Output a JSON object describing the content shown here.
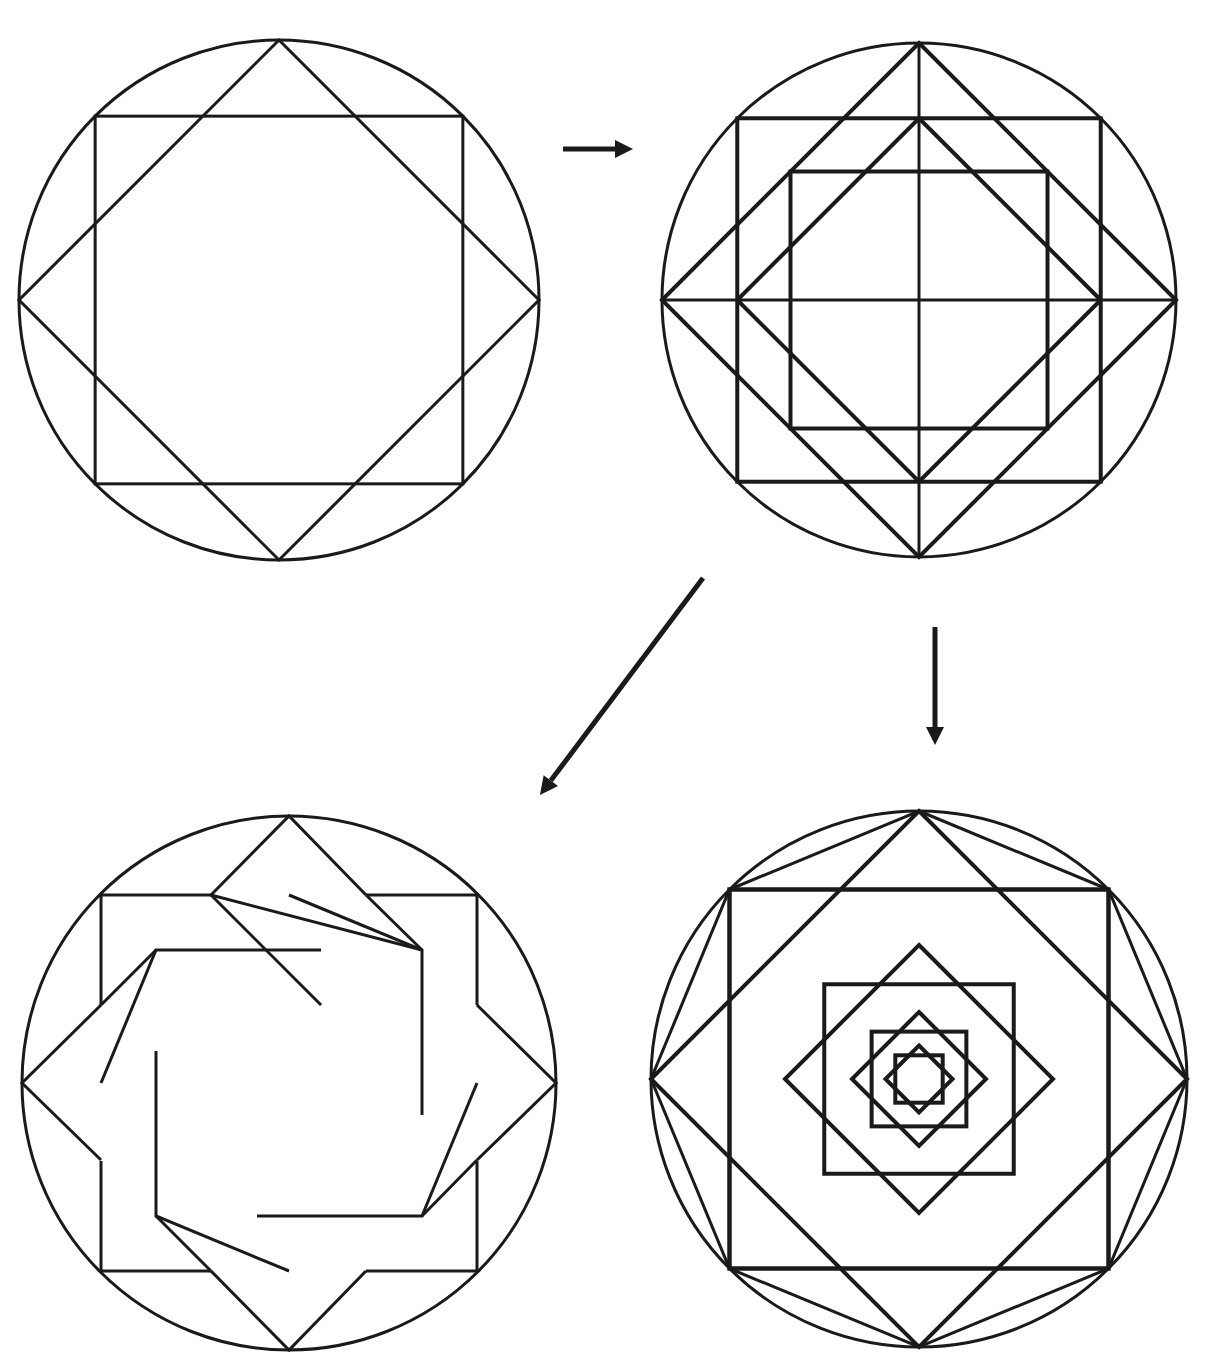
{
  "caption": {
    "text": "",
    "note": "clipped text line at top edge, only descenders visible"
  },
  "colors": {
    "ink": "#1a1a1a",
    "background": "#ffffff"
  },
  "figures": [
    {
      "id": "figure-1-star-octagram",
      "description": "Circle with inscribed axis-aligned square and inscribed diamond (8-point star)",
      "center": [
        279,
        300
      ],
      "radius": 260,
      "stroke_width": 3,
      "elements": [
        "circle",
        "square",
        "diamond"
      ]
    },
    {
      "id": "figure-2-construction",
      "description": "Circle with inscribed square and diamond, inner square and diamond, vertical and horizontal diameters",
      "center": [
        919,
        300
      ],
      "radius": 257,
      "stroke_width": 4,
      "elements": [
        "circle",
        "square",
        "diamond",
        "inner-square",
        "inner-diamond",
        "cross"
      ]
    },
    {
      "id": "figure-3-interlaced-star",
      "description": "Circle with interlaced square and diamond bands forming woven eight-pointed star",
      "center": [
        289,
        1083
      ],
      "radius": 267,
      "stroke_width": 3,
      "outer_half": 188,
      "inner_half": 133
    },
    {
      "id": "figure-4-nested-squares",
      "description": "Circle with inscribed octagon and successively nested alternating squares and diamonds",
      "center": [
        919,
        1079
      ],
      "radius": 268,
      "stroke_width": 4,
      "nesting_levels": 8,
      "ratio": 0.7071
    }
  ],
  "arrows": [
    {
      "id": "arrow-right",
      "from": [
        563,
        149
      ],
      "to": [
        633,
        149
      ]
    },
    {
      "id": "arrow-diagonal",
      "from": [
        703,
        578
      ],
      "to": [
        540,
        795
      ]
    },
    {
      "id": "arrow-down",
      "from": [
        935,
        627
      ],
      "to": [
        935,
        745
      ]
    }
  ]
}
